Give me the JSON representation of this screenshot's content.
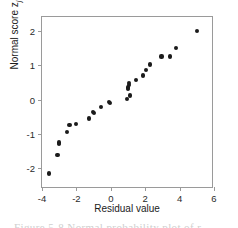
{
  "figure": {
    "caption": "Figure 5-8   Normal probability plot of r"
  },
  "axes": {
    "x": {
      "label": "Residual value",
      "ticks": [
        -4,
        -2,
        0,
        2,
        4,
        6
      ],
      "tick_labels": [
        "-4",
        "-2",
        "0",
        "2",
        "4",
        "6"
      ],
      "min": -4,
      "max": 6
    },
    "y": {
      "label": "Normal score z",
      "label_subscript": "j",
      "ticks": [
        -2,
        -1,
        0,
        1,
        2
      ],
      "tick_labels": [
        "-2",
        "-1",
        "0",
        "1",
        "2"
      ],
      "min": -2.6,
      "max": 2.4
    }
  },
  "style": {
    "marker_color": "#1b1b1b",
    "frame_color": "#9a9a9a",
    "background": "#ffffff"
  },
  "chart_data": {
    "type": "scatter",
    "title": "",
    "xlabel": "Residual value",
    "ylabel": "Normal score z_j",
    "xlim": [
      -4,
      6
    ],
    "ylim": [
      -2.6,
      2.4
    ],
    "grid": false,
    "legend": false,
    "series": [
      {
        "name": "residuals",
        "x": [
          -3.6,
          -3.1,
          -3.0,
          -3.0,
          -2.55,
          -2.4,
          -2.0,
          -1.25,
          -1.05,
          -1.0,
          -0.55,
          -0.1,
          -0.05,
          0.95,
          1.0,
          1.0,
          1.05,
          1.05,
          1.1,
          1.45,
          1.85,
          2.05,
          2.3,
          2.95,
          3.45,
          3.8,
          5.0
        ],
        "y": [
          -2.15,
          -1.6,
          -1.25,
          -1.3,
          -0.95,
          -0.75,
          -0.7,
          -0.55,
          -0.35,
          -0.38,
          -0.22,
          -0.08,
          -0.1,
          0.02,
          0.3,
          0.35,
          0.42,
          0.47,
          0.12,
          0.58,
          0.7,
          0.85,
          1.02,
          1.25,
          1.25,
          1.5,
          2.0
        ]
      }
    ]
  }
}
